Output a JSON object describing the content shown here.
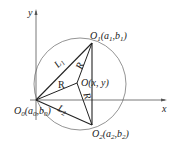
{
  "diagram": {
    "axes": {
      "x_label": "x",
      "y_label": "y"
    },
    "points": {
      "O0": {
        "name": "O",
        "sub": "0",
        "coords": "(a",
        "csub1": "0",
        "mid": ",b",
        "csub2": "0",
        "close": ")"
      },
      "O1": {
        "name": "O",
        "sub": "1",
        "coords": "(a",
        "csub1": "1",
        "mid": ",b",
        "csub2": "1",
        "close": ")"
      },
      "O2": {
        "name": "O",
        "sub": "2",
        "coords": "(a",
        "csub1": "2",
        "mid": ",b",
        "csub2": "2",
        "close": ")"
      },
      "O": {
        "label": "O(x, y)"
      }
    },
    "segments": {
      "L1": {
        "name": "L",
        "sub": "1"
      },
      "L2": {
        "name": "L",
        "sub": "2"
      },
      "R_left": "R",
      "R_top": "R",
      "R_bottom": "R"
    },
    "colors": {
      "line": "#222222",
      "circle": "#555555"
    }
  }
}
